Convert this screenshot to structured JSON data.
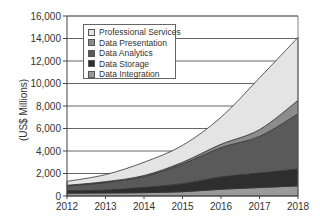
{
  "chart_data": {
    "type": "area",
    "stacked": true,
    "title": "",
    "xlabel": "",
    "ylabel": "(US$ Millions)",
    "x": [
      "2012",
      "2013",
      "2014",
      "2015",
      "2016",
      "2017",
      "2018"
    ],
    "ylim": [
      0,
      16000
    ],
    "yticks": [
      "0",
      "2,000",
      "4,000",
      "6,000",
      "8,000",
      "10,000",
      "12,000",
      "14,000",
      "16,000"
    ],
    "yticks_values": [
      0,
      2000,
      4000,
      6000,
      8000,
      10000,
      12000,
      14000,
      16000
    ],
    "grid": true,
    "legend_position": "upper-left-inside",
    "series": [
      {
        "name": "Data Integration",
        "color": "#9a9a9a",
        "values": [
          250,
          270,
          300,
          380,
          600,
          750,
          900
        ]
      },
      {
        "name": "Data Storage",
        "color": "#2e2e2e",
        "values": [
          220,
          260,
          470,
          720,
          1100,
          1300,
          1500
        ]
      },
      {
        "name": "Data Analytics",
        "color": "#5a5a5a",
        "values": [
          430,
          670,
          950,
          1750,
          2600,
          3250,
          4900
        ]
      },
      {
        "name": "Data Presentation",
        "color": "#8c8c8c",
        "values": [
          50,
          80,
          100,
          150,
          300,
          600,
          1200
        ]
      },
      {
        "name": "Professional Services",
        "color": "#e4e4e4",
        "values": [
          350,
          620,
          1180,
          1500,
          2400,
          4600,
          5600
        ]
      }
    ]
  },
  "legend": {
    "items": [
      {
        "label": "Professional Services",
        "color": "#e4e4e4"
      },
      {
        "label": "Data Presentation",
        "color": "#8c8c8c"
      },
      {
        "label": "Data Analytics",
        "color": "#5a5a5a"
      },
      {
        "label": "Data Storage",
        "color": "#2e2e2e"
      },
      {
        "label": "Data Integration",
        "color": "#9a9a9a"
      }
    ]
  }
}
